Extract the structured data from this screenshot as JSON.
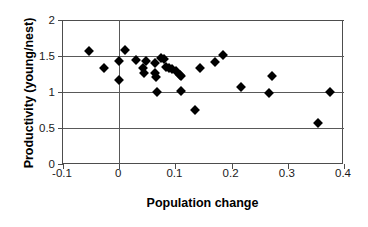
{
  "chart_data": {
    "type": "scatter",
    "title": "",
    "xlabel": "Population change",
    "ylabel": "Productivity (young/nest)",
    "xlim": [
      -0.1,
      0.4
    ],
    "ylim": [
      0,
      2
    ],
    "xticks": [
      -0.1,
      0,
      0.1,
      0.2,
      0.3,
      0.4
    ],
    "xtick_labels": [
      "-0.1",
      "0",
      "0.1",
      "0.2",
      "0.3",
      "0.4"
    ],
    "yticks": [
      0,
      0.5,
      1,
      1.5,
      2
    ],
    "ytick_labels": [
      "0",
      "0.5",
      "1",
      "1.5",
      "2"
    ],
    "grid": "horizontal",
    "legend": "none",
    "marker": "filled-diamond",
    "marker_color": "#000000",
    "series": [
      {
        "name": "observations",
        "points": [
          [
            -0.053,
            1.57
          ],
          [
            -0.027,
            1.34
          ],
          [
            0.0,
            1.43
          ],
          [
            0.0,
            1.17
          ],
          [
            0.011,
            1.58
          ],
          [
            0.03,
            1.45
          ],
          [
            0.042,
            1.33
          ],
          [
            0.045,
            1.26
          ],
          [
            0.048,
            1.43
          ],
          [
            0.063,
            1.4
          ],
          [
            0.064,
            1.26
          ],
          [
            0.065,
            1.21
          ],
          [
            0.067,
            1.0
          ],
          [
            0.075,
            1.47
          ],
          [
            0.079,
            1.46
          ],
          [
            0.083,
            1.35
          ],
          [
            0.089,
            1.33
          ],
          [
            0.094,
            1.32
          ],
          [
            0.101,
            1.29
          ],
          [
            0.108,
            1.24
          ],
          [
            0.11,
            1.22
          ],
          [
            0.11,
            1.02
          ],
          [
            0.134,
            0.75
          ],
          [
            0.143,
            1.34
          ],
          [
            0.17,
            1.42
          ],
          [
            0.184,
            1.51
          ],
          [
            0.216,
            1.07
          ],
          [
            0.266,
            0.99
          ],
          [
            0.272,
            1.22
          ],
          [
            0.354,
            0.57
          ],
          [
            0.375,
            1.0
          ]
        ]
      }
    ]
  }
}
